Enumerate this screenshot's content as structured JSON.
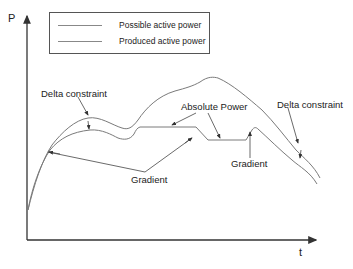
{
  "diagram": {
    "axes": {
      "y_label": "P",
      "x_label": "t"
    },
    "legend": {
      "items": [
        {
          "label": "Possible active power",
          "color": "#888888"
        },
        {
          "label": "Produced active power",
          "color": "#888888"
        }
      ]
    },
    "annotations": {
      "delta_constraint_left": "Delta constraint",
      "absolute_power": "Absolute Power",
      "delta_constraint_right": "Delta constraint",
      "gradient_middle": "Gradient",
      "gradient_bottom": "Gradient"
    },
    "colors": {
      "curve": "#7a7a7a",
      "axis": "#333333",
      "arrow": "#444444",
      "text": "#222222"
    }
  }
}
